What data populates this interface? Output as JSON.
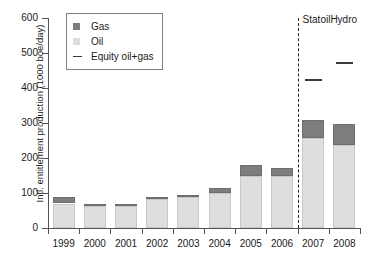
{
  "chart_data": {
    "type": "bar",
    "title": "",
    "xlabel": "",
    "ylabel": "Intl. entitlement production (1000 boe/day)",
    "ylim": [
      0,
      600
    ],
    "ytick_labels": [
      "0",
      "100",
      "200",
      "300",
      "400",
      "500",
      "600"
    ],
    "ytick_values": [
      0,
      100,
      200,
      300,
      400,
      500,
      600
    ],
    "grid": false,
    "stacked": true,
    "categories": [
      "1999",
      "2000",
      "2001",
      "2002",
      "2003",
      "2004",
      "2005",
      "2006",
      "2007",
      "2008"
    ],
    "series": [
      {
        "name": "Oil",
        "color": "#dedede",
        "values": [
          70,
          62,
          62,
          84,
          90,
          100,
          150,
          148,
          258,
          238
        ]
      },
      {
        "name": "Gas",
        "color": "#7d7d7d",
        "values": [
          18,
          6,
          6,
          5,
          3,
          15,
          30,
          24,
          52,
          58
        ]
      }
    ],
    "totals": [
      88,
      68,
      68,
      89,
      93,
      115,
      180,
      172,
      310,
      296
    ],
    "equity_marker": {
      "name": "Equity oil+gas",
      "color": "#3a3a3a",
      "points": [
        {
          "category": "2007",
          "value": 425
        },
        {
          "category": "2008",
          "value": 475
        }
      ]
    },
    "annotations": [
      {
        "text": "StatoilHydro",
        "type": "divider-label",
        "after_category": "2006"
      }
    ],
    "legend": {
      "position": "top-left",
      "entries": [
        {
          "label": "Gas",
          "marker": "square",
          "color": "#7d7d7d"
        },
        {
          "label": "Oil",
          "marker": "square",
          "color": "#dedede"
        },
        {
          "label": "Equity oil+gas",
          "marker": "line",
          "color": "#3a3a3a"
        }
      ]
    }
  }
}
